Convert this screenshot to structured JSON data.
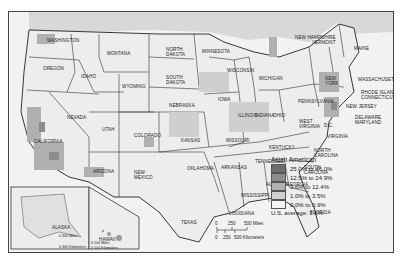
{
  "map": {
    "subject": "Asian American population share by county",
    "states": [
      {
        "name": "WASHINGTON",
        "x": 38,
        "y": 26
      },
      {
        "name": "OREGON",
        "x": 34,
        "y": 54
      },
      {
        "name": "IDAHO",
        "x": 72,
        "y": 62
      },
      {
        "name": "MONTANA",
        "x": 98,
        "y": 39
      },
      {
        "name": "NORTH\nDAKOTA",
        "x": 157,
        "y": 35
      },
      {
        "name": "SOUTH\nDAKOTA",
        "x": 157,
        "y": 63
      },
      {
        "name": "MINNESOTA",
        "x": 193,
        "y": 37
      },
      {
        "name": "WISCONSIN",
        "x": 218,
        "y": 56
      },
      {
        "name": "MICHIGAN",
        "x": 250,
        "y": 64
      },
      {
        "name": "WYOMING",
        "x": 113,
        "y": 72
      },
      {
        "name": "NEBRASKA",
        "x": 160,
        "y": 91
      },
      {
        "name": "IOWA",
        "x": 209,
        "y": 85
      },
      {
        "name": "ILLINOIS",
        "x": 229,
        "y": 101
      },
      {
        "name": "INDIANA",
        "x": 246,
        "y": 101
      },
      {
        "name": "OHIO",
        "x": 264,
        "y": 101
      },
      {
        "name": "PENNSYLVANIA",
        "x": 289,
        "y": 87
      },
      {
        "name": "NEW\nYORK",
        "x": 316,
        "y": 64
      },
      {
        "name": "NEVADA",
        "x": 58,
        "y": 103
      },
      {
        "name": "UTAH",
        "x": 93,
        "y": 115
      },
      {
        "name": "COLORADO",
        "x": 125,
        "y": 121
      },
      {
        "name": "KANSAS",
        "x": 172,
        "y": 126
      },
      {
        "name": "MISSOURI",
        "x": 217,
        "y": 126
      },
      {
        "name": "KENTUCKY",
        "x": 260,
        "y": 133
      },
      {
        "name": "WEST\nVIRGINIA",
        "x": 290,
        "y": 107
      },
      {
        "name": "VIRGINIA",
        "x": 318,
        "y": 122
      },
      {
        "name": "CALIFORNIA",
        "x": 25,
        "y": 127
      },
      {
        "name": "ARIZONA",
        "x": 84,
        "y": 157
      },
      {
        "name": "NEW\nMEXICO",
        "x": 125,
        "y": 158
      },
      {
        "name": "OKLAHOMA",
        "x": 178,
        "y": 154
      },
      {
        "name": "ARKANSAS",
        "x": 212,
        "y": 153
      },
      {
        "name": "TENNESSEE",
        "x": 246,
        "y": 147
      },
      {
        "name": "NORTH\nCAROLINA",
        "x": 305,
        "y": 136
      },
      {
        "name": "SOUTH\nCAROLINA",
        "x": 295,
        "y": 153
      },
      {
        "name": "GEORGIA",
        "x": 277,
        "y": 170
      },
      {
        "name": "ALABAMA",
        "x": 257,
        "y": 170
      },
      {
        "name": "MISSISSIPPI",
        "x": 232,
        "y": 181
      },
      {
        "name": "LOUISIANA",
        "x": 220,
        "y": 199
      },
      {
        "name": "TEXAS",
        "x": 172,
        "y": 208
      },
      {
        "name": "FLORIDA",
        "x": 301,
        "y": 198
      },
      {
        "name": "MAINE",
        "x": 345,
        "y": 34
      },
      {
        "name": "NEW HAMPSHIRE\nVERMONT",
        "x": 286,
        "y": 23
      },
      {
        "name": "MASSACHUSETTS",
        "x": 349,
        "y": 65
      },
      {
        "name": "RHODE ISLAND\nCONNECTICUT",
        "x": 352,
        "y": 78
      },
      {
        "name": "NEW JERSEY",
        "x": 337,
        "y": 92
      },
      {
        "name": "DELAWARE\nMARYLAND",
        "x": 346,
        "y": 103
      },
      {
        "name": "D.C.",
        "x": 315,
        "y": 111
      },
      {
        "name": "ALASKA",
        "x": 43,
        "y": 213
      },
      {
        "name": "HAWAII",
        "x": 90,
        "y": 225
      }
    ]
  },
  "legend": {
    "title": "Asian American",
    "items": [
      {
        "label": "25.0% to 46.0%",
        "color": "#6e6e6e"
      },
      {
        "label": "12.5% to 24.9%",
        "color": "#8c8c8c"
      },
      {
        "label": "3.6% to 12.4%",
        "color": "#b0b0b0"
      },
      {
        "label": "1.0% to 3.5%",
        "color": "#cfcfcf"
      },
      {
        "label": "0.0% to 0.9%",
        "color": "#f4f4f4"
      }
    ],
    "average": "U.S. average: 3.6%"
  },
  "scale": {
    "miles": [
      "0",
      "250",
      "500 Miles"
    ],
    "km": [
      "0",
      "250",
      "500 Kilometers"
    ]
  },
  "alaska_scale": {
    "miles": "0    300 Miles",
    "km": "0 300 Kilometers"
  },
  "hawaii_scale": {
    "miles": "0   100 Miles",
    "km": "0  100 Kilometers"
  }
}
